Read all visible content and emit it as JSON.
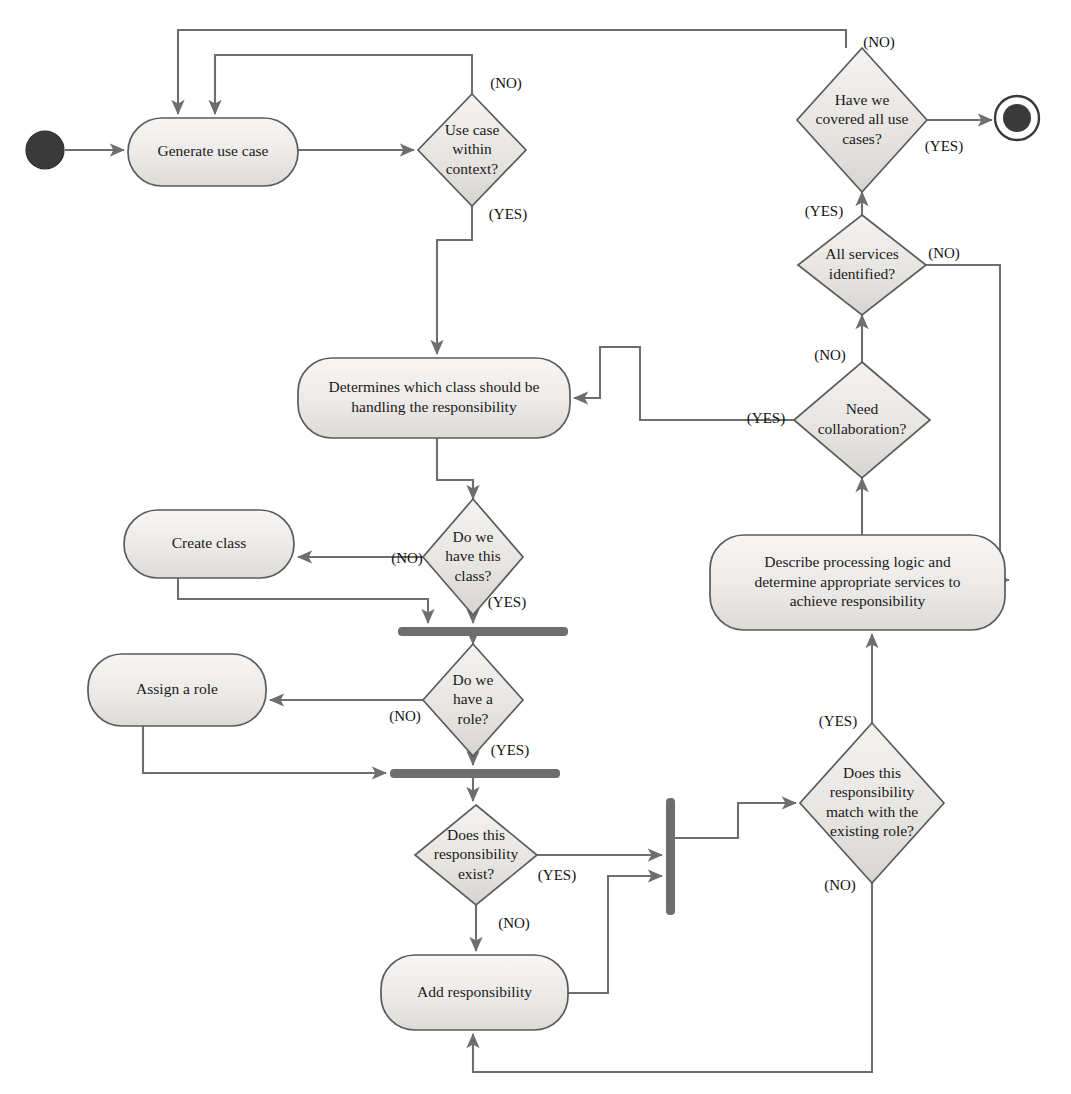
{
  "diagram": {
    "type": "uml-activity-diagram",
    "canvas": {
      "width": 1071,
      "height": 1094
    },
    "style": {
      "node_fill_light": "#f0efee",
      "node_fill_dark": "#d9d8d6",
      "node_stroke": "#5b5b5b",
      "edge_stroke": "#6e6e6e",
      "bar_fill": "#6e6e6e",
      "text_color": "#1a1a1a",
      "background": "#ffffff"
    },
    "nodes": [
      {
        "id": "start",
        "kind": "initial-node",
        "label": "",
        "cx": 45,
        "cy": 150
      },
      {
        "id": "generate",
        "kind": "action",
        "label": "Generate use case",
        "x": 128,
        "y": 118,
        "w": 170,
        "h": 68
      },
      {
        "id": "within",
        "kind": "decision",
        "label": "Use case\nwithin\ncontext?",
        "cx": 472,
        "cy": 150,
        "rx": 54,
        "ry": 56
      },
      {
        "id": "covered",
        "kind": "decision",
        "label": "Have we\ncovered all use\ncases?",
        "cx": 862,
        "cy": 120,
        "rx": 65,
        "ry": 72
      },
      {
        "id": "end",
        "kind": "final-node",
        "label": "",
        "cx": 1017,
        "cy": 118
      },
      {
        "id": "allservices",
        "kind": "decision",
        "label": "All services\nidentified?",
        "cx": 862,
        "cy": 265,
        "rx": 64,
        "ry": 50
      },
      {
        "id": "determines",
        "kind": "action",
        "label": "Determines which class should be\nhandling the responsibility",
        "x": 298,
        "y": 358,
        "w": 272,
        "h": 80
      },
      {
        "id": "needcollab",
        "kind": "decision",
        "label": "Need\ncollaboration?",
        "cx": 862,
        "cy": 420,
        "rx": 68,
        "ry": 58
      },
      {
        "id": "havethisclass",
        "kind": "decision",
        "label": "Do we\nhave this\nclass?",
        "cx": 473,
        "cy": 557,
        "rx": 50,
        "ry": 58
      },
      {
        "id": "createclass",
        "kind": "action",
        "label": "Create class",
        "x": 124,
        "y": 510,
        "w": 170,
        "h": 68
      },
      {
        "id": "describe",
        "kind": "action",
        "label": "Describe processing logic and\ndetermine appropriate services to\nachieve responsibility",
        "x": 710,
        "y": 535,
        "w": 295,
        "h": 95
      },
      {
        "id": "bar1",
        "kind": "join-bar",
        "label": "",
        "x": 398,
        "y": 627,
        "w": 170,
        "h": 9,
        "orientation": "horizontal"
      },
      {
        "id": "havearole",
        "kind": "decision",
        "label": "Do we\nhave a\nrole?",
        "cx": 473,
        "cy": 700,
        "rx": 50,
        "ry": 56
      },
      {
        "id": "assignrole",
        "kind": "action",
        "label": "Assign a role",
        "x": 88,
        "y": 654,
        "w": 178,
        "h": 72
      },
      {
        "id": "bar2",
        "kind": "join-bar",
        "label": "",
        "x": 390,
        "y": 769,
        "w": 170,
        "h": 9,
        "orientation": "horizontal"
      },
      {
        "id": "respexist",
        "kind": "decision",
        "label": "Does this\nresponsibility\nexist?",
        "cx": 476,
        "cy": 855,
        "rx": 61,
        "ry": 50
      },
      {
        "id": "bar3",
        "kind": "fork-bar",
        "label": "",
        "x": 666,
        "y": 798,
        "w": 9,
        "h": 117,
        "orientation": "vertical"
      },
      {
        "id": "respmatch",
        "kind": "decision",
        "label": "Does this\nresponsibility\nmatch with the\nexisting role?",
        "cx": 872,
        "cy": 803,
        "rx": 72,
        "ry": 80
      },
      {
        "id": "addresp",
        "kind": "action",
        "label": "Add responsibility",
        "x": 381,
        "y": 955,
        "w": 187,
        "h": 75
      }
    ],
    "guards": [
      {
        "id": "g1",
        "text": "(NO)",
        "x": 506,
        "y": 85,
        "from": "within",
        "to": "generate"
      },
      {
        "id": "g2",
        "text": "(YES)",
        "x": 508,
        "y": 216,
        "from": "within",
        "to": "determines"
      },
      {
        "id": "g3",
        "text": "(NO)",
        "x": 879,
        "y": 44,
        "from": "covered",
        "to": "generate"
      },
      {
        "id": "g4",
        "text": "(YES)",
        "x": 944,
        "y": 148,
        "from": "covered",
        "to": "end"
      },
      {
        "id": "g5",
        "text": "(YES)",
        "x": 824,
        "y": 213,
        "from": "allservices",
        "to": "covered"
      },
      {
        "id": "g6",
        "text": "(NO)",
        "x": 944,
        "y": 255,
        "from": "allservices",
        "to": "describe"
      },
      {
        "id": "g7",
        "text": "(NO)",
        "x": 830,
        "y": 357,
        "from": "needcollab",
        "to": "allservices"
      },
      {
        "id": "g8",
        "text": "(YES)",
        "x": 766,
        "y": 420,
        "from": "needcollab",
        "to": "determines"
      },
      {
        "id": "g9",
        "text": "(NO)",
        "x": 407,
        "y": 560,
        "from": "havethisclass",
        "to": "createclass"
      },
      {
        "id": "g10",
        "text": "(YES)",
        "x": 507,
        "y": 604,
        "from": "havethisclass",
        "to": "bar1"
      },
      {
        "id": "g11",
        "text": "(NO)",
        "x": 405,
        "y": 718,
        "from": "havearole",
        "to": "assignrole"
      },
      {
        "id": "g12",
        "text": "(YES)",
        "x": 510,
        "y": 752,
        "from": "havearole",
        "to": "bar2"
      },
      {
        "id": "g13",
        "text": "(YES)",
        "x": 557,
        "y": 877,
        "from": "respexist",
        "to": "bar3"
      },
      {
        "id": "g14",
        "text": "(NO)",
        "x": 514,
        "y": 925,
        "from": "respexist",
        "to": "addresp"
      },
      {
        "id": "g15",
        "text": "(YES)",
        "x": 838,
        "y": 723,
        "from": "respmatch",
        "to": "describe"
      },
      {
        "id": "g16",
        "text": "(NO)",
        "x": 840,
        "y": 887,
        "from": "respmatch",
        "to": "addresp"
      }
    ],
    "edges": [
      {
        "id": "e-start-generate",
        "from": "start",
        "to": "generate",
        "path": "M 65 150 L 124 150",
        "arrow": true
      },
      {
        "id": "e-generate-within",
        "from": "generate",
        "to": "within",
        "path": "M 298 150 L 414 150",
        "arrow": true
      },
      {
        "id": "e-within-no-generate",
        "from": "within",
        "to": "generate",
        "path": "M 472 94 L 472 55 L 215 55 L 215 114",
        "arrow": true
      },
      {
        "id": "e-covered-no-generate",
        "from": "covered",
        "to": "generate",
        "path": "M 846 48 L 846 30 L 178 30 L 178 114",
        "arrow": true
      },
      {
        "id": "e-covered-yes-end",
        "from": "covered",
        "to": "end",
        "path": "M 927 120 L 992 120",
        "arrow": true
      },
      {
        "id": "e-within-yes-determines",
        "from": "within",
        "to": "determines",
        "path": "M 472 206 L 472 240 L 437 240 L 437 354",
        "arrow": true
      },
      {
        "id": "e-allservices-covered",
        "from": "allservices",
        "to": "covered",
        "path": "M 862 215 L 862 192",
        "arrow": true
      },
      {
        "id": "e-allservices-describe",
        "from": "allservices",
        "to": "describe",
        "path": "M 926 265 L 1000 265 L 1000 580 L 1009 580",
        "arrow": true
      },
      {
        "id": "e-needcollab-allservices",
        "from": "needcollab",
        "to": "allservices",
        "path": "M 862 362 L 862 315",
        "arrow": true
      },
      {
        "id": "e-needcollab-determines",
        "from": "needcollab",
        "to": "determines",
        "path": "M 794 420 L 640 420 L 640 347 L 600 347 L 600 398 L 574 398",
        "arrow": true
      },
      {
        "id": "e-describe-needcollab",
        "from": "describe",
        "to": "needcollab",
        "path": "M 862 535 L 862 478",
        "arrow": true
      },
      {
        "id": "e-determines-class",
        "from": "determines",
        "to": "havethisclass",
        "path": "M 437 438 L 437 480 L 473 480 L 473 499",
        "arrow": true
      },
      {
        "id": "e-class-no-create",
        "from": "havethisclass",
        "to": "createclass",
        "path": "M 423 557 L 298 557",
        "arrow": true
      },
      {
        "id": "e-class-yes-bar1",
        "from": "havethisclass",
        "to": "bar1",
        "path": "M 473 615 L 473 623",
        "arrow": true
      },
      {
        "id": "e-create-bar1",
        "from": "createclass",
        "to": "bar1",
        "path": "M 178 578 L 178 599 L 428 599 L 428 623",
        "arrow": true
      },
      {
        "id": "e-bar1-role",
        "from": "bar1",
        "to": "havearole",
        "path": "M 473 636 L 473 644",
        "arrow": true
      },
      {
        "id": "e-role-no-assign",
        "from": "havearole",
        "to": "assignrole",
        "path": "M 423 700 L 270 700",
        "arrow": true
      },
      {
        "id": "e-role-yes-bar2",
        "from": "havearole",
        "to": "bar2",
        "path": "M 473 756 L 473 765",
        "arrow": true
      },
      {
        "id": "e-assign-bar2",
        "from": "assignrole",
        "to": "bar2",
        "path": "M 143 726 L 143 773 L 386 773",
        "arrow": true
      },
      {
        "id": "e-bar2-respexist",
        "from": "bar2",
        "to": "respexist",
        "path": "M 473 778 L 473 801",
        "arrow": true
      },
      {
        "id": "e-respexist-yes-bar3",
        "from": "respexist",
        "to": "bar3",
        "path": "M 537 855 L 662 855",
        "arrow": true
      },
      {
        "id": "e-respexist-no-addresp",
        "from": "respexist",
        "to": "addresp",
        "path": "M 476 905 L 476 951",
        "arrow": true
      },
      {
        "id": "e-addresp-bar3",
        "from": "addresp",
        "to": "bar3",
        "path": "M 568 993 L 608 993 L 608 876 L 662 876",
        "arrow": true
      },
      {
        "id": "e-bar3-respmatch",
        "from": "bar3",
        "to": "respmatch",
        "path": "M 675 838 L 738 838 L 738 803 L 796 803",
        "arrow": true
      },
      {
        "id": "e-respmatch-yes-describe",
        "from": "respmatch",
        "to": "describe",
        "path": "M 872 723 L 872 634",
        "arrow": true
      },
      {
        "id": "e-respmatch-no-addresp",
        "from": "respmatch",
        "to": "addresp",
        "path": "M 872 883 L 872 1072 L 473 1072 L 473 1034",
        "arrow": true
      }
    ]
  }
}
